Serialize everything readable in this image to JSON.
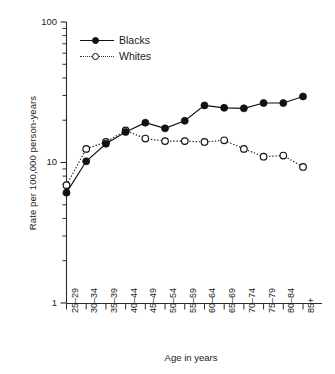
{
  "chart_data": {
    "type": "line",
    "title": "",
    "xlabel": "Age in years",
    "ylabel": "Rate per 100,000 person-years",
    "categories": [
      "25–29",
      "30–34",
      "35–39",
      "40–44",
      "45–49",
      "50–54",
      "55–59",
      "60–64",
      "65–69",
      "70–74",
      "75–79",
      "80–84",
      "85+"
    ],
    "yscale": "log",
    "ylim": [
      1,
      100
    ],
    "ytick_labels": [
      "100",
      "10",
      "1"
    ],
    "ytick_values": [
      100,
      10,
      1
    ],
    "grid": false,
    "legend_position": "upper-left",
    "series": [
      {
        "name": "Blacks",
        "marker": "filled-circle",
        "linestyle": "solid",
        "color": "#111111",
        "values": [
          6.1,
          10.2,
          13.6,
          16.5,
          19.2,
          17.5,
          19.8,
          25.5,
          24.5,
          24.3,
          26.5,
          26.5,
          29.5
        ]
      },
      {
        "name": "Whites",
        "marker": "open-circle",
        "linestyle": "dotted",
        "color": "#111111",
        "values": [
          6.9,
          12.5,
          14.0,
          16.9,
          14.8,
          14.2,
          14.2,
          14.0,
          14.4,
          12.5,
          11.0,
          11.2,
          9.3
        ]
      }
    ]
  },
  "legend": {
    "items": [
      {
        "label": "Blacks"
      },
      {
        "label": "Whites"
      }
    ]
  }
}
